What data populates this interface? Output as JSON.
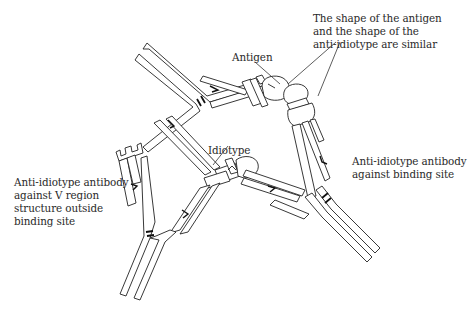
{
  "figure": {
    "labels": {
      "antigen": "Antigen",
      "shape_note": "The shape of the antigen\nand the shape of the\nanti-idiotype are similar",
      "idiotype": "Idiotype",
      "anti_id_binding_site": "Anti-idiotype antibody\nagainst binding site",
      "anti_id_v_region": "Anti-idiotype antibody\nagainst V region\nstructure outside\nbinding site"
    },
    "structures": [
      {
        "name": "idiotype-antibody",
        "description": "Central antibody whose arm binds the antigen (upper right) and whose other arm bears the idiotype"
      },
      {
        "name": "antigen",
        "description": "Rounded antigen bound at upper-right arm tip"
      },
      {
        "name": "anti-idiotype-antibody-binding-site",
        "description": "Right antibody binding the idiotype via its binding site; its tip resembles the antigen shape"
      },
      {
        "name": "anti-idiotype-antibody-v-region",
        "description": "Lower-left antibody binding a V region structure outside the binding site"
      }
    ],
    "colors": {
      "stroke": "#222222",
      "fill": "#ffffff",
      "text": "#2a2a2a"
    }
  }
}
